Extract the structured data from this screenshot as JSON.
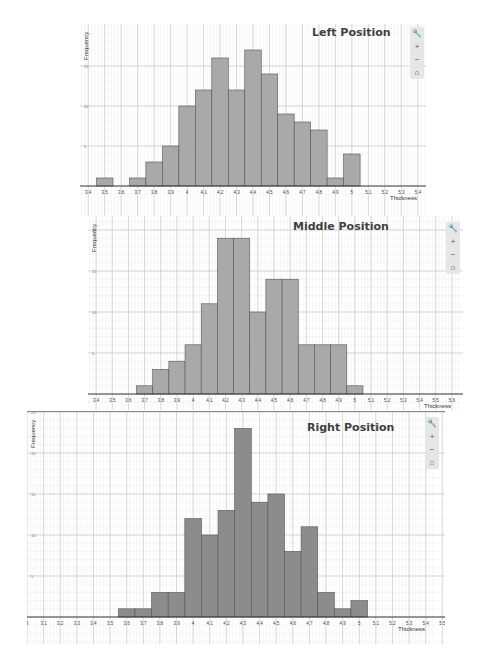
{
  "chart_data": [
    {
      "type": "bar",
      "title": "Left Position",
      "xlabel": "Thickness",
      "ylabel": "Frequency",
      "x_ticks": [
        "3.4",
        "3.5",
        "3.6",
        "3.7",
        "3.8",
        "3.9",
        "4",
        "4.1",
        "4.2",
        "4.3",
        "4.4",
        "4.5",
        "4.6",
        "4.7",
        "4.8",
        "4.9",
        "5",
        "5.1",
        "5.2",
        "5.3",
        "5.4"
      ],
      "y_ticks": [
        5,
        10,
        15
      ],
      "ylim": [
        0,
        18
      ],
      "xlim": [
        3.35,
        5.45
      ],
      "grid": true,
      "categories": [
        "3.5",
        "3.6",
        "3.7",
        "3.8",
        "3.9",
        "4.0",
        "4.1",
        "4.2",
        "4.3",
        "4.4",
        "4.5",
        "4.6",
        "4.7",
        "4.8",
        "4.9",
        "5.0"
      ],
      "values": [
        1,
        0,
        1,
        3,
        5,
        10,
        12,
        16,
        12,
        17,
        14,
        9,
        8,
        7,
        1,
        4
      ],
      "bar_color": "#a9a9a9"
    },
    {
      "type": "bar",
      "title": "Middle Position",
      "xlabel": "Thickness",
      "ylabel": "Frequency",
      "x_ticks": [
        "3.4",
        "3.5",
        "3.6",
        "3.7",
        "3.8",
        "3.9",
        "4",
        "4.1",
        "4.2",
        "4.3",
        "4.4",
        "4.5",
        "4.6",
        "4.7",
        "4.8",
        "4.9",
        "5",
        "5.1",
        "5.2",
        "5.3",
        "5.4",
        "5.5",
        "5.6"
      ],
      "y_ticks": [
        5,
        10,
        15,
        20
      ],
      "ylim": [
        0,
        21
      ],
      "xlim": [
        3.35,
        5.65
      ],
      "grid": true,
      "categories": [
        "3.7",
        "3.8",
        "3.9",
        "4.0",
        "4.1",
        "4.2",
        "4.3",
        "4.4",
        "4.5",
        "4.6",
        "4.7",
        "4.8",
        "4.9",
        "5.0"
      ],
      "values": [
        1,
        3,
        4,
        6,
        11,
        19,
        19,
        10,
        14,
        14,
        6,
        6,
        6,
        1
      ],
      "bar_color": "#a9a9a9"
    },
    {
      "type": "bar",
      "title": "Right Position",
      "xlabel": "Thickness",
      "ylabel": "Frequency",
      "x_ticks": [
        "3",
        "3.1",
        "3.2",
        "3.3",
        "3.4",
        "3.5",
        "3.6",
        "3.7",
        "3.8",
        "3.9",
        "4",
        "4.1",
        "4.2",
        "4.3",
        "4.4",
        "4.5",
        "4.6",
        "4.7",
        "4.8",
        "4.9",
        "5",
        "5.1",
        "5.2",
        "5.3",
        "5.4",
        "5.5"
      ],
      "y_ticks": [
        5,
        10,
        15,
        20,
        25
      ],
      "ylim": [
        0,
        25
      ],
      "xlim": [
        3.0,
        5.45
      ],
      "grid": true,
      "categories": [
        "3.6",
        "3.7",
        "3.8",
        "3.9",
        "4.0",
        "4.1",
        "4.2",
        "4.3",
        "4.4",
        "4.5",
        "4.6",
        "4.7",
        "4.8",
        "4.9",
        "5.0"
      ],
      "values": [
        1,
        1,
        3,
        3,
        12,
        10,
        13,
        23,
        14,
        15,
        8,
        11,
        3,
        1,
        2
      ],
      "bar_color": "#8c8c8c"
    }
  ],
  "toolbar": {
    "wrench_icon": "wrench-icon",
    "zoom_in": "+",
    "zoom_out": "−",
    "home": "⌂"
  }
}
